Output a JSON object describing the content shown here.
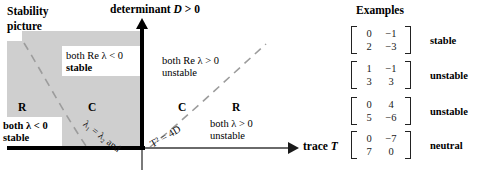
{
  "figure": {
    "title": "Stability picture",
    "title_line1": "Stability",
    "title_line2": "picture"
  },
  "axes": {
    "vertical_label": "determinant D > 0",
    "vertical_label_prefix": "determinant",
    "vertical_label_var": "D",
    "vertical_label_suffix": "> 0",
    "horizontal_label": "trace T",
    "horizontal_label_prefix": "trace",
    "horizontal_label_var": "T"
  },
  "regions": [
    {
      "id": "upper-left-complex",
      "eigen_label": "",
      "line1": "both Re λ < 0",
      "line2": "stable"
    },
    {
      "id": "upper-right-complex",
      "eigen_label": "",
      "line1": "both Re λ > 0",
      "line2": "unstable"
    },
    {
      "id": "lower-left-real",
      "eigen_label": "R",
      "line1": "both λ < 0",
      "line2": "stable"
    },
    {
      "id": "lower-right-real",
      "eigen_label": "R",
      "line1": "both λ > 0",
      "line2": "unstable"
    }
  ],
  "complex_markers": {
    "left": "C",
    "right": "C"
  },
  "curve_labels": {
    "left": "λ₁ = λ₂ and",
    "right": "T² = 4D"
  },
  "examples": {
    "heading": "Examples",
    "rows": [
      {
        "matrix": [
          [
            "0",
            "−1"
          ],
          [
            "2",
            "−3"
          ]
        ],
        "verdict": "stable"
      },
      {
        "matrix": [
          [
            "1",
            "−1"
          ],
          [
            "3",
            "3"
          ]
        ],
        "verdict": "unstable"
      },
      {
        "matrix": [
          [
            "0",
            "4"
          ],
          [
            "5",
            "−6"
          ]
        ],
        "verdict": "unstable"
      },
      {
        "matrix": [
          [
            "0",
            "−7"
          ],
          [
            "7",
            "0"
          ]
        ],
        "verdict": "neutral"
      }
    ]
  },
  "colors": {
    "shading": "#cfcfcf",
    "axis": "#000000",
    "axis_thin": "#6a6a6a",
    "dashed_curve": "#9a9a9a",
    "text": "#000000"
  }
}
